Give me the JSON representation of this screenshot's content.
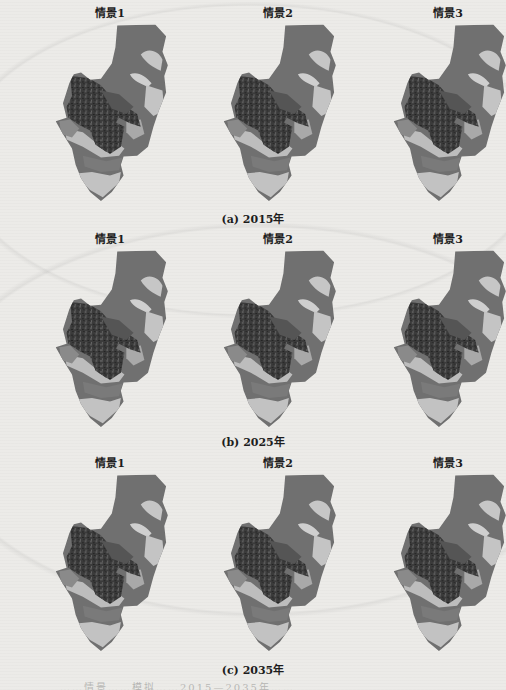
{
  "figure": {
    "rows": [
      {
        "caption": "(a) 2015年",
        "panels": [
          {
            "title": "情景1"
          },
          {
            "title": "情景2"
          },
          {
            "title": "情景3"
          }
        ]
      },
      {
        "caption": "(b) 2025年",
        "panels": [
          {
            "title": "情景1"
          },
          {
            "title": "情景2"
          },
          {
            "title": "情景3"
          }
        ]
      },
      {
        "caption": "(c) 2035年",
        "panels": [
          {
            "title": "情景1"
          },
          {
            "title": "情景2"
          },
          {
            "title": "情景3"
          }
        ]
      }
    ],
    "bottom_caption_partial": "……情景……模拟……2015—2035年……"
  },
  "colors": {
    "page": "#ecebe8",
    "map_dark": "#3a3a3a",
    "map_mid": "#6e6e6e",
    "map_light": "#c9c9c9",
    "map_base": "#707070"
  }
}
